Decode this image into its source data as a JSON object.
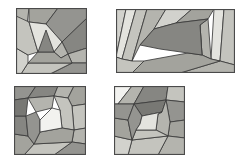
{
  "figure": {
    "background_color": "#ffffff",
    "width": 245,
    "height": 162,
    "outline_color": "#3b3b3b",
    "frame_color": "#4a4a4a"
  },
  "palette": {
    "lightest": "#f2f2ef",
    "very_light": "#e3e3de",
    "light": "#d2d2cd",
    "light_mid": "#c4c4be",
    "mid": "#b4b4ae",
    "mid_dark": "#a3a39d",
    "dark": "#949490",
    "darker": "#868682",
    "darkest": "#787874"
  },
  "panels": [
    {
      "id": "panel-top-left",
      "label": "a",
      "x": 16,
      "y": 8,
      "width": 71,
      "height": 66,
      "shape": "square",
      "tile_count": 13,
      "center_tone": "darker",
      "description": "Square dissected into a triangular pinwheel spiral of quadrilateral strips winding to a dark central triangle",
      "tiles": [
        {
          "name": "strip-outer-left",
          "fill": "#b4b4ae",
          "points": "0,0 13,0 5,66 0,66"
        },
        {
          "name": "strip-outer-top",
          "fill": "#a3a39d",
          "points": "13,0 42,0 30,16 13,14"
        },
        {
          "name": "strip-top-right",
          "fill": "#949490",
          "points": "42,0 71,0 71,10 46,34 30,16"
        },
        {
          "name": "strip-right-upper",
          "fill": "#868682",
          "points": "71,10 71,40 52,46 46,34"
        },
        {
          "name": "strip-right-lower",
          "fill": "#b4b4ae",
          "points": "71,40 71,55 56,55 52,46"
        },
        {
          "name": "strip-bottom-right",
          "fill": "#949490",
          "points": "71,55 71,66 34,66 56,55"
        },
        {
          "name": "strip-bottom",
          "fill": "#c4c4be",
          "points": "34,66 5,66 12,55 56,55"
        },
        {
          "name": "strip-lower-left",
          "fill": "#d2d2cd",
          "points": "5,66 0,66 0,40 12,47 12,55"
        },
        {
          "name": "strip-inner-left",
          "fill": "#c4c4be",
          "points": "0,40 0,8 13,14 22,44 12,47"
        },
        {
          "name": "strip-inner-top",
          "fill": "#e3e3de",
          "points": "13,14 30,16 46,34 38,44 22,44"
        },
        {
          "name": "strip-inner-right",
          "fill": "#b4b4ae",
          "points": "46,34 52,46 45,50 38,44"
        },
        {
          "name": "strip-inner-bottom",
          "fill": "#a3a39d",
          "points": "52,46 56,55 12,55 22,44 38,44 45,50"
        },
        {
          "name": "core-triangle",
          "fill": "#868682",
          "points": "22,44 38,44 30,22"
        }
      ]
    },
    {
      "id": "panel-top-right",
      "label": "b",
      "x": 116,
      "y": 9,
      "width": 119,
      "height": 64,
      "shape": "rectangle",
      "tile_count": 14,
      "center_tone": "dark",
      "description": "Wide rectangle dissected into a spiral of slanted quadrilateral strips around a large dark pentagonal core",
      "tiles": [
        {
          "name": "strip-left-edge",
          "fill": "#d2d2cd",
          "points": "0,0 10,0 0,48 0,0"
        },
        {
          "name": "strip-left-outer",
          "fill": "#e3e3de",
          "points": "10,0 20,0 6,50 0,48"
        },
        {
          "name": "strip-left-inner",
          "fill": "#c4c4be",
          "points": "20,0 31,0 16,52 6,50"
        },
        {
          "name": "strip-top-left",
          "fill": "#b4b4ae",
          "points": "31,0 50,0 38,20 24,36 16,52"
        },
        {
          "name": "strip-top-mid",
          "fill": "#d2d2cd",
          "points": "50,0 76,0 60,14 38,20"
        },
        {
          "name": "strip-top-right",
          "fill": "#a3a39d",
          "points": "76,0 98,0 92,10 60,14"
        },
        {
          "name": "strip-right-pale",
          "fill": "#e3e3de",
          "points": "98,0 108,0 104,52 95,50"
        },
        {
          "name": "strip-right-edge",
          "fill": "#c4c4be",
          "points": "108,0 119,0 119,56 104,52"
        },
        {
          "name": "strip-right-inner",
          "fill": "#b4b4ae",
          "points": "92,10 95,50 86,46 84,16"
        },
        {
          "name": "strip-core-right",
          "fill": "#949490",
          "points": "84,16 86,46 72,44 74,18"
        },
        {
          "name": "strip-bottom-right",
          "fill": "#b4b4ae",
          "points": "104,52 119,56 119,64 64,64"
        },
        {
          "name": "strip-bottom-mid",
          "fill": "#a3a39d",
          "points": "64,64 16,64 28,52 72,44 86,46 95,50 104,52"
        },
        {
          "name": "strip-bottom-left",
          "fill": "#c4c4be",
          "points": "16,64 0,64 0,48 6,50 16,52 28,52"
        },
        {
          "name": "core-pentagon",
          "fill": "#868682",
          "points": "38,20 60,14 92,10 84,16 86,46 72,44 44,40 24,36"
        }
      ]
    },
    {
      "id": "panel-bottom-left",
      "label": "c",
      "x": 14,
      "y": 86,
      "width": 72,
      "height": 69,
      "shape": "square",
      "tile_count": 16,
      "center_tone": "lightest",
      "description": "Square dissected into a tight inward spiral of quadrilateral strips converging on a small bright pale core",
      "tiles": [
        {
          "name": "strip-outer-top-left",
          "fill": "#949490",
          "points": "0,0 22,0 14,12 0,14"
        },
        {
          "name": "strip-outer-top",
          "fill": "#868682",
          "points": "22,0 44,0 40,10 14,12"
        },
        {
          "name": "strip-outer-top-right",
          "fill": "#b4b4ae",
          "points": "44,0 60,0 54,12 40,10"
        },
        {
          "name": "strip-right-top",
          "fill": "#a3a39d",
          "points": "60,0 72,0 72,18 58,20 54,12"
        },
        {
          "name": "strip-right-mid",
          "fill": "#c4c4be",
          "points": "72,18 72,42 60,44 58,20"
        },
        {
          "name": "strip-right-low",
          "fill": "#b4b4ae",
          "points": "72,42 72,58 58,56 60,44"
        },
        {
          "name": "strip-bottom-right",
          "fill": "#949490",
          "points": "72,58 72,69 40,69 58,56"
        },
        {
          "name": "strip-bottom",
          "fill": "#c4c4be",
          "points": "40,69 10,69 20,58 58,56"
        },
        {
          "name": "strip-bottom-left",
          "fill": "#a3a39d",
          "points": "10,69 0,69 0,48 14,50 20,58"
        },
        {
          "name": "strip-left-low",
          "fill": "#868682",
          "points": "0,48 0,30 12,30 14,50"
        },
        {
          "name": "strip-left-top",
          "fill": "#787874",
          "points": "0,30 0,14 14,12 12,30"
        },
        {
          "name": "strip-ring2-top",
          "fill": "#b4b4ae",
          "points": "14,12 40,10 38,22 22,26"
        },
        {
          "name": "strip-ring2-right",
          "fill": "#c4c4be",
          "points": "40,10 54,12 58,20 60,44 48,42 46,24"
        },
        {
          "name": "strip-ring2-bottom",
          "fill": "#a3a39d",
          "points": "60,44 58,56 20,58 26,46 48,42"
        },
        {
          "name": "strip-ring2-left",
          "fill": "#949490",
          "points": "20,58 14,50 12,30 22,26 26,34 26,46"
        },
        {
          "name": "core-bright",
          "fill": "#f2f2ef",
          "points": "26,34 38,22 46,24 48,42 26,46"
        }
      ]
    },
    {
      "id": "panel-bottom-right",
      "label": "d",
      "x": 114,
      "y": 86,
      "width": 71,
      "height": 69,
      "shape": "square",
      "tile_count": 16,
      "center_tone": "very_light",
      "description": "Square dissected into an octagonal spiral of strips with pale cut corners and a light quadrilateral core",
      "tiles": [
        {
          "name": "corner-top-left",
          "fill": "#f2f2ef",
          "points": "0,0 18,0 4,18 0,18"
        },
        {
          "name": "strip-top-left",
          "fill": "#b4b4ae",
          "points": "18,0 30,0 20,18 4,18"
        },
        {
          "name": "strip-top-mid",
          "fill": "#868682",
          "points": "30,0 54,0 52,14 20,18"
        },
        {
          "name": "corner-top-right",
          "fill": "#c4c4be",
          "points": "54,0 71,0 71,16 52,14"
        },
        {
          "name": "strip-right-upper",
          "fill": "#949490",
          "points": "71,16 71,34 56,36 52,14"
        },
        {
          "name": "strip-right-lower",
          "fill": "#a3a39d",
          "points": "71,34 71,52 54,50 56,36"
        },
        {
          "name": "corner-bottom-right",
          "fill": "#b4b4ae",
          "points": "71,52 71,69 44,69 54,50"
        },
        {
          "name": "strip-bottom",
          "fill": "#c4c4be",
          "points": "44,69 14,69 18,54 54,50"
        },
        {
          "name": "corner-bottom-left",
          "fill": "#d2d2cd",
          "points": "14,69 0,69 0,50 18,54"
        },
        {
          "name": "strip-left-lower",
          "fill": "#a3a39d",
          "points": "0,50 0,32 14,34 18,54"
        },
        {
          "name": "strip-left-upper",
          "fill": "#949490",
          "points": "0,32 0,18 4,18 20,18 14,34"
        },
        {
          "name": "strip-ring2-top",
          "fill": "#787874",
          "points": "20,18 52,14 48,26 28,30"
        },
        {
          "name": "strip-ring2-right",
          "fill": "#b4b4ae",
          "points": "52,14 56,36 54,50 42,44 44,28 48,26"
        },
        {
          "name": "strip-ring2-bottom",
          "fill": "#c4c4be",
          "points": "54,50 18,54 22,44 42,44"
        },
        {
          "name": "strip-ring2-left",
          "fill": "#949490",
          "points": "18,54 14,34 20,18 28,30 26,38 22,44"
        },
        {
          "name": "core-light",
          "fill": "#e3e3de",
          "points": "26,38 28,30 48,26 44,28 42,44 22,44"
        }
      ]
    }
  ]
}
